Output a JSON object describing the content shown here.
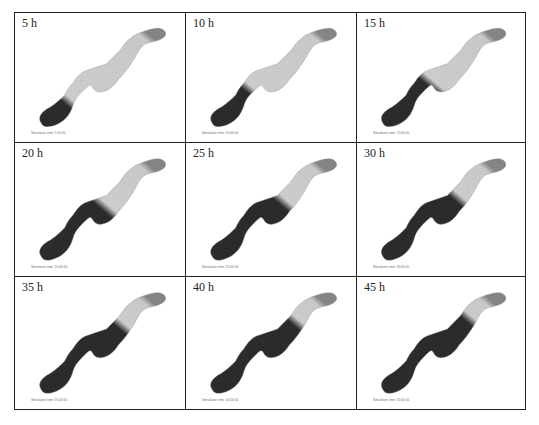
{
  "figure": {
    "panels": [
      {
        "label": "5 h",
        "caption": "Simulation time: 5:00:00",
        "dark_fraction": 0.12
      },
      {
        "label": "10 h",
        "caption": "Simulation time: 10:00:00",
        "dark_fraction": 0.25
      },
      {
        "label": "15 h",
        "caption": "Simulation time: 15:00:00",
        "dark_fraction": 0.35
      },
      {
        "label": "20 h",
        "caption": "Simulation time: 20:00:00",
        "dark_fraction": 0.48
      },
      {
        "label": "25 h",
        "caption": "Simulation time: 25:00:00",
        "dark_fraction": 0.55
      },
      {
        "label": "30 h",
        "caption": "Simulation time: 30:00:00",
        "dark_fraction": 0.6
      },
      {
        "label": "35 h",
        "caption": "Simulation time: 35:00:00",
        "dark_fraction": 0.66
      },
      {
        "label": "40 h",
        "caption": "Simulation time: 40:00:00",
        "dark_fraction": 0.7
      },
      {
        "label": "45 h",
        "caption": "Simulation time: 45:00:00",
        "dark_fraction": 0.74
      }
    ],
    "colors": {
      "dark": "#2e2e2e",
      "light": "#d4d4d4",
      "border": "#222222"
    }
  }
}
